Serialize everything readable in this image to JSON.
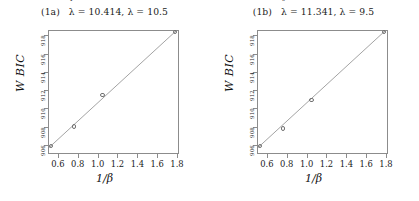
{
  "figure": {
    "panels": [
      {
        "tag": "(1a)",
        "title_lambda_hat": "λ = 10.414,",
        "title_lambda": "λ = 10.5",
        "hat_mark": "ˇ",
        "xlabel": "1/β",
        "ylabel": "W BIC"
      },
      {
        "tag": "(1b)",
        "title_lambda_hat": "λ = 11.341,",
        "title_lambda": "λ = 9.5",
        "hat_mark": "ˆ",
        "xlabel": "1/β",
        "ylabel": "W BIC"
      }
    ]
  },
  "chart_data": [
    {
      "type": "scatter",
      "title": "(1a)   λ̂ = 10.414, λ = 10.5",
      "xlabel": "1/β",
      "ylabel": "W BIC",
      "xlim": [
        0.5,
        1.82
      ],
      "ylim": [
        905.0,
        918.6
      ],
      "xticks": [
        0.6,
        0.8,
        1.0,
        1.2,
        1.4,
        1.6,
        1.8
      ],
      "xtick_labels": [
        "0.6",
        "0.8",
        "1.0",
        "1.2",
        "1.4",
        "1.6",
        "1.8"
      ],
      "yticks": [
        906,
        908,
        910,
        912,
        914,
        916,
        918
      ],
      "ytick_labels": [
        "906",
        "908",
        "910",
        "912",
        "914",
        "916",
        "918"
      ],
      "grid": false,
      "legend": "none",
      "series": [
        {
          "name": "WBIC points",
          "x": [
            0.53,
            0.76,
            1.05,
            1.78
          ],
          "y": [
            905.9,
            908.0,
            911.5,
            918.4
          ]
        },
        {
          "name": "fitted line",
          "x": [
            0.5,
            1.82
          ],
          "y": [
            905.6,
            918.8
          ]
        }
      ],
      "annotations": [
        "lambda_hat = 10.414",
        "lambda = 10.5"
      ]
    },
    {
      "type": "scatter",
      "title": "(1b)   λ̂ = 11.341, λ = 9.5",
      "xlabel": "1/β",
      "ylabel": "W BIC",
      "xlim": [
        0.5,
        1.82
      ],
      "ylim": [
        905.0,
        918.6
      ],
      "xticks": [
        0.6,
        0.8,
        1.0,
        1.2,
        1.4,
        1.6,
        1.8
      ],
      "xtick_labels": [
        "0.6",
        "0.8",
        "1.0",
        "1.2",
        "1.4",
        "1.6",
        "1.8"
      ],
      "yticks": [
        906,
        908,
        910,
        912,
        914,
        916,
        918
      ],
      "ytick_labels": [
        "906",
        "908",
        "910",
        "912",
        "914",
        "916",
        "918"
      ],
      "grid": false,
      "legend": "none",
      "series": [
        {
          "name": "WBIC points",
          "x": [
            0.53,
            0.76,
            1.05,
            1.78
          ],
          "y": [
            905.9,
            907.8,
            910.9,
            918.4
          ]
        },
        {
          "name": "fitted line",
          "x": [
            0.5,
            1.82
          ],
          "y": [
            905.6,
            918.8
          ]
        }
      ],
      "annotations": [
        "lambda_hat = 11.341",
        "lambda = 9.5"
      ]
    }
  ],
  "style": {
    "line_color": "#8c8c8c",
    "marker_color": "#707070",
    "text_color": "#1a1a1a",
    "background": "#ffffff"
  }
}
